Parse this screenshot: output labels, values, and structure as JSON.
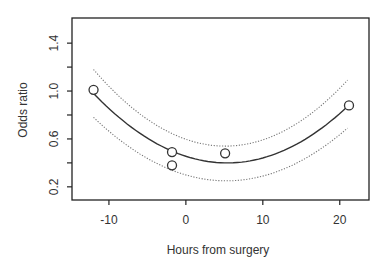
{
  "chart_data": {
    "type": "scatter",
    "title": "",
    "xlabel": "Hours from surgery",
    "ylabel": "Odds ratio",
    "xlim": [
      -14.8,
      23.8
    ],
    "ylim": [
      0.09,
      1.61
    ],
    "xticks": [
      -10,
      0,
      10,
      20
    ],
    "xtick_labels": [
      "-10",
      "0",
      "10",
      "20"
    ],
    "yticks": [
      0.2,
      0.4,
      0.6,
      0.8,
      1.0,
      1.2,
      1.4
    ],
    "ytick_labels": [
      "0.2",
      "",
      "0.6",
      "",
      "1.0",
      "",
      "1.4"
    ],
    "grid": false,
    "legend": null,
    "points": [
      {
        "x": -12,
        "y": 1.01
      },
      {
        "x": -1.8,
        "y": 0.49
      },
      {
        "x": -1.8,
        "y": 0.38
      },
      {
        "x": 5.1,
        "y": 0.48
      },
      {
        "x": 21.2,
        "y": 0.88
      }
    ],
    "series": [
      {
        "name": "fitted",
        "style": "solid",
        "x_range": [
          -12,
          21
        ],
        "quadratic": [
          0.4551,
          -0.02065,
          0.001924
        ]
      },
      {
        "name": "upper_ci",
        "style": "dotted",
        "x_range": [
          -12,
          21
        ],
        "quadratic": [
          0.5972,
          -0.02236,
          0.002183
        ]
      },
      {
        "name": "lower_ci",
        "style": "dotted",
        "x_range": [
          -12,
          21
        ],
        "quadratic": [
          0.2993,
          -0.01873,
          0.001778
        ]
      }
    ]
  },
  "layout": {
    "plot": {
      "left": 72,
      "top": 18,
      "right": 369,
      "bottom": 200
    },
    "line_color": "#222222",
    "dot_color": "#555555"
  }
}
